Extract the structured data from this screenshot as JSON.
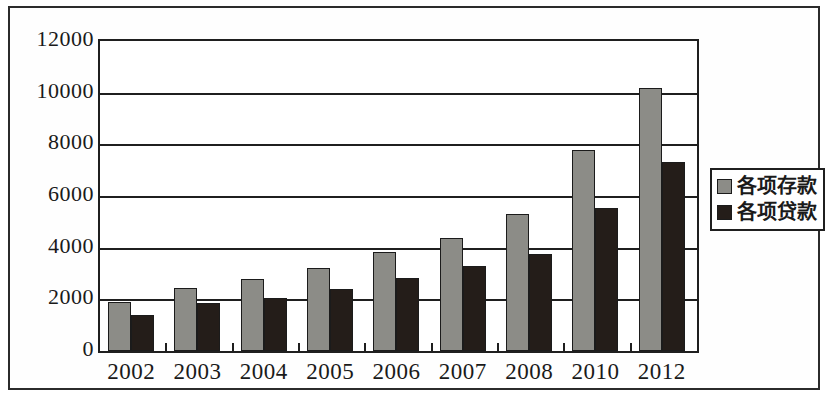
{
  "chart_data": {
    "type": "bar",
    "title": "",
    "subtitle": "",
    "xlabel": "",
    "ylabel": "",
    "categories": [
      "2002",
      "2003",
      "2004",
      "2005",
      "2006",
      "2007",
      "2008",
      "2010",
      "2012"
    ],
    "series": [
      {
        "name": "各项存款",
        "color": "#8c8c87",
        "values": [
          1900,
          2450,
          2780,
          3200,
          3820,
          4380,
          5300,
          7800,
          10200
        ]
      },
      {
        "name": "各项贷款",
        "color": "#241d19",
        "values": [
          1400,
          1850,
          2050,
          2400,
          2820,
          3280,
          3750,
          5550,
          7300
        ]
      }
    ],
    "ylim": [
      0,
      12000
    ],
    "ytick_values": [
      0,
      2000,
      4000,
      6000,
      8000,
      10000,
      12000
    ],
    "ytick_labels": [
      "0",
      "2000",
      "4000",
      "6000",
      "8000",
      "10000",
      "12000"
    ],
    "grid": true,
    "grid_axis": "y",
    "legend_position": "right",
    "legend_entries": [
      "各项存款",
      "各项贷款"
    ]
  }
}
